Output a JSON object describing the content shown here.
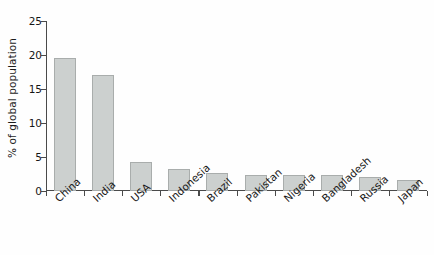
{
  "chart_data": {
    "type": "bar",
    "title": "",
    "subtitle": "",
    "xlabel": "",
    "ylabel": "% of global population",
    "ylim": [
      0,
      25
    ],
    "yticks": [
      0,
      5,
      10,
      15,
      20,
      25
    ],
    "ytick_labels": [
      "0",
      "5",
      "10",
      "15",
      "20",
      "25"
    ],
    "grid": false,
    "legend": null,
    "bar_color": "#ccd0cf",
    "bar_edge_color": "#a9adac",
    "axis_color": "#4a4a4a",
    "background_color": "#fefefe",
    "categories": [
      "China",
      "India",
      "USA",
      "Indonesia",
      "Brazil",
      "Pakistan",
      "Nigeria",
      "Bangladesh",
      "Russia",
      "Japan"
    ],
    "values": [
      19.5,
      17.0,
      4.3,
      3.3,
      2.7,
      2.4,
      2.4,
      2.3,
      2.0,
      1.6
    ]
  }
}
